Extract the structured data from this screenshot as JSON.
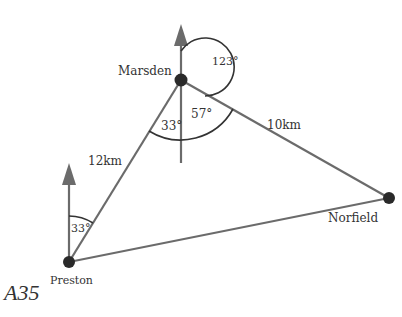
{
  "diagram": {
    "points": [
      {
        "name": "Marsden",
        "x": 181,
        "y": 80
      },
      {
        "name": "Preston",
        "x": 69,
        "y": 262
      },
      {
        "name": "Norfield",
        "x": 389,
        "y": 198
      }
    ],
    "distances": [
      {
        "from": "Preston",
        "to": "Marsden",
        "label": "12km"
      },
      {
        "from": "Marsden",
        "to": "Norfield",
        "label": "10km"
      }
    ],
    "angles": {
      "preston_bearing": "33°",
      "marsden_back_bearing": "33°",
      "marsden_interior": "57°",
      "marsden_bearing_norfield": "123°"
    },
    "colors": {
      "line": "#6b6b6b",
      "arrow": "#6b6b6b",
      "dot": "#2a2a2a",
      "arc": "#333333"
    }
  },
  "labels": {
    "marsden": "Marsden",
    "preston": "Preston",
    "norfield": "Norfield",
    "dist_pm": "12km",
    "dist_mn": "10km",
    "angle_preston": "33°",
    "angle_m33": "33°",
    "angle_m57": "57°",
    "angle_m123": "123°"
  },
  "caption": "A35"
}
